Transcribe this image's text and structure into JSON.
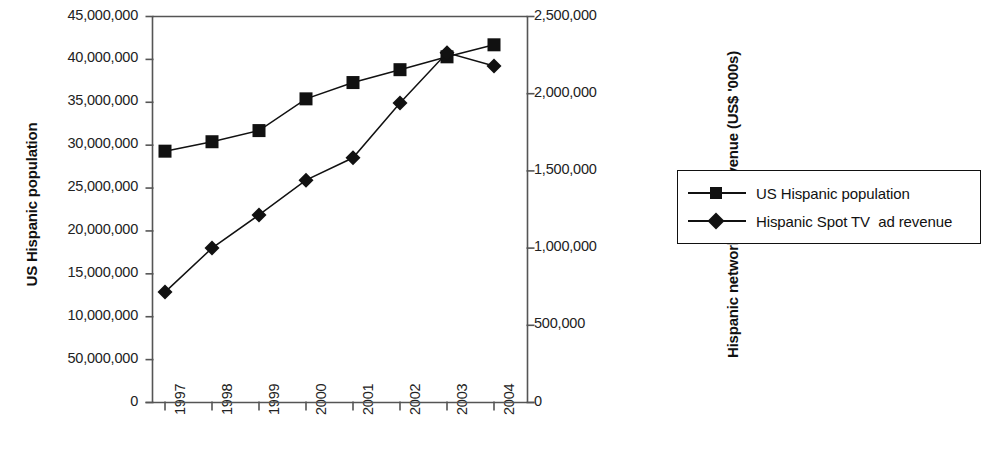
{
  "chart_data": {
    "type": "line",
    "title": "",
    "subtitle": "",
    "xlabel": "",
    "categories": [
      "1997",
      "1998",
      "1999",
      "2000",
      "2001",
      "2002",
      "2003",
      "2004"
    ],
    "axes": {
      "left": {
        "label": "US Hispanic population",
        "ticks": [
          "0",
          "50,000,000",
          "10,000,000",
          "15,000,000",
          "20,000,000",
          "25,000,000",
          "30,000,000",
          "35,000,000",
          "40,000,000",
          "45,000,000"
        ],
        "tick_values": [
          0,
          5000000,
          10000000,
          15000000,
          20000000,
          25000000,
          30000000,
          35000000,
          40000000,
          45000000
        ],
        "ylim": [
          0,
          45000000
        ]
      },
      "right": {
        "label": "Hispanic network TV ad revenue (US$ '000s)",
        "ticks": [
          "0",
          "500,000",
          "1,000,000",
          "1,500,000",
          "2,000,000",
          "2,500,000"
        ],
        "tick_values": [
          0,
          500000,
          1000000,
          1500000,
          2000000,
          2500000
        ],
        "ylim": [
          0,
          2500000
        ]
      }
    },
    "grid": false,
    "legend_position": "right",
    "series": [
      {
        "name": "US Hispanic population",
        "marker": "square",
        "axis": "left",
        "values": [
          29300000,
          30400000,
          31700000,
          35400000,
          37300000,
          38800000,
          40300000,
          41700000
        ]
      },
      {
        "name": "Hispanic Spot TV  ad revenue",
        "marker": "diamond",
        "axis": "right",
        "values": [
          715000,
          1000000,
          1215000,
          1440000,
          1585000,
          1940000,
          2265000,
          2180000
        ]
      }
    ]
  },
  "legend": {
    "items": [
      {
        "label": "US Hispanic population",
        "marker": "square"
      },
      {
        "label": "Hispanic Spot TV  ad revenue",
        "marker": "diamond"
      }
    ]
  },
  "colors": {
    "series": "#111111",
    "axis": "#555555",
    "text": "#1a1a1a",
    "background": "#ffffff"
  }
}
